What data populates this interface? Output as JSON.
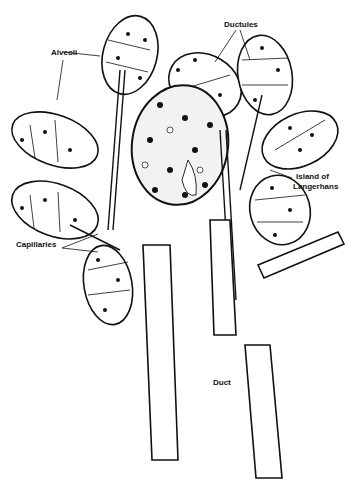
{
  "figure": {
    "type": "anatomical line drawing",
    "colors": {
      "ink": "#111111",
      "background": "#ffffff"
    }
  },
  "labels": {
    "alveoli": "Alveoli",
    "ductules": "Ductules",
    "island_line1": "Island of",
    "island_line2": "Langerhans",
    "capillaries": "Capillaries",
    "duct": "Duct"
  }
}
